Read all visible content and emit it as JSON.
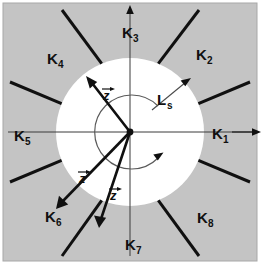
{
  "figure": {
    "background_color": "#ffffff",
    "shaded_color": "#c4c4c4",
    "disc_color": "#ffffff",
    "line_color": "#101010",
    "thin_line_color": "#3a3a3a"
  },
  "sectors": [
    {
      "id": "K1",
      "label": "K",
      "subscript": "1",
      "angle_deg": 0,
      "has_axis_arrow": true
    },
    {
      "id": "K2",
      "label": "K",
      "subscript": "2",
      "angle_deg": 45,
      "has_axis_arrow": false
    },
    {
      "id": "K3",
      "label": "K",
      "subscript": "3",
      "angle_deg": 90,
      "has_axis_arrow": true
    },
    {
      "id": "K4",
      "label": "K",
      "subscript": "4",
      "angle_deg": 135,
      "has_axis_arrow": false
    },
    {
      "id": "K5",
      "label": "K",
      "subscript": "5",
      "angle_deg": 180,
      "has_axis_arrow": false
    },
    {
      "id": "K6",
      "label": "K",
      "subscript": "6",
      "angle_deg": 225,
      "has_axis_arrow": false
    },
    {
      "id": "K7",
      "label": "K",
      "subscript": "7",
      "angle_deg": 270,
      "has_axis_arrow": false
    },
    {
      "id": "K8",
      "label": "K",
      "subscript": "8",
      "angle_deg": 315,
      "has_axis_arrow": false
    }
  ],
  "radius_annotation": {
    "label": "L",
    "subscript": "s",
    "description": "radius of inner white disc",
    "arrow_angle_deg": 45
  },
  "vectors": [
    {
      "id": "z-upper-left",
      "label": "z",
      "accent": "arrow",
      "angle_deg": 128,
      "length_px": 62
    },
    {
      "id": "z-lower-left",
      "label": "z",
      "accent": "arrow",
      "angle_deg": 226,
      "length_px": 97
    },
    {
      "id": "z-lower-right",
      "label": "z",
      "accent": "arrow",
      "angle_deg": 252,
      "length_px": 92
    }
  ],
  "rotation_arc": {
    "id": "rotation-direction-arc",
    "description": "inner circular arc indicating rotation sense",
    "radius_px": 37,
    "arrowhead_angle_deg": -40
  },
  "axes": {
    "horizontal": true,
    "vertical": true
  }
}
